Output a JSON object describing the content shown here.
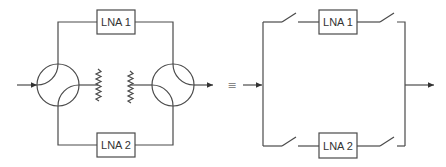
{
  "diagram": {
    "left": {
      "amplifiers": [
        {
          "label": "LNA 1"
        },
        {
          "label": "LNA 2"
        }
      ],
      "components": [
        "input-hybrid-coupler",
        "output-hybrid-coupler",
        "termination-resistor-1",
        "termination-resistor-2"
      ]
    },
    "equivalence_symbol": "≡",
    "right": {
      "amplifiers": [
        {
          "label": "LNA 1"
        },
        {
          "label": "LNA 2"
        }
      ],
      "components": [
        "switch-top-in",
        "switch-top-out",
        "switch-bottom-in",
        "switch-bottom-out"
      ]
    },
    "colors": {
      "line": "#4a4a4a",
      "background": "#ffffff"
    }
  }
}
